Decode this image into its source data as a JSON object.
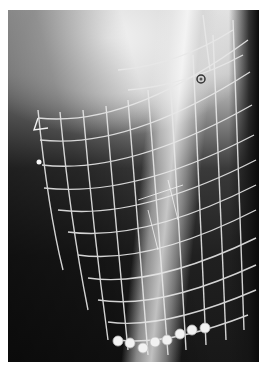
{
  "image": {
    "description": "Radiograph of a limb segment with a deformed wire mesh grid overlay, a row of screws at the bottom, and small circular markers",
    "frame": {
      "border_color": "#ffffff",
      "x": 8,
      "y": 10,
      "width": 251,
      "height": 352
    },
    "colors": {
      "background_dark": "#181818",
      "background_light": "#e6e6e6",
      "grid": "#e8e8e8",
      "bone": "#f0f0f0"
    },
    "markers": [
      {
        "type": "ring",
        "x": 201,
        "y": 79
      },
      {
        "type": "dot",
        "x": 39,
        "y": 162
      }
    ],
    "screws": [
      {
        "x": 118,
        "y": 341
      },
      {
        "x": 130,
        "y": 343
      },
      {
        "x": 143,
        "y": 348
      },
      {
        "x": 155,
        "y": 342
      },
      {
        "x": 167,
        "y": 340
      },
      {
        "x": 180,
        "y": 334
      },
      {
        "x": 192,
        "y": 330
      },
      {
        "x": 205,
        "y": 328
      }
    ]
  }
}
